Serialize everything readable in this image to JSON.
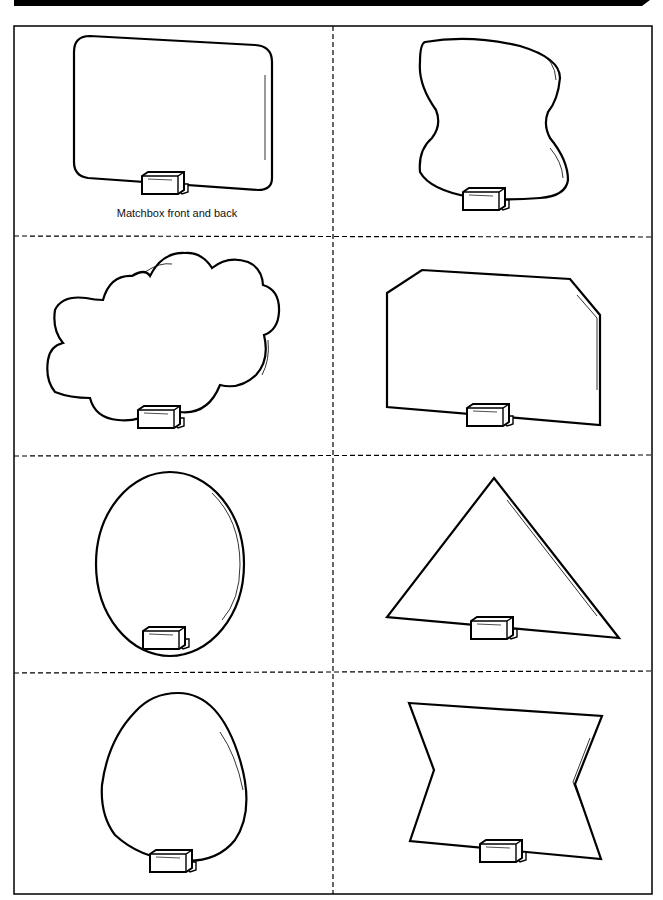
{
  "page": {
    "header_bar": "black banner strip",
    "caption": "Matchbox front and back"
  },
  "cards": [
    {
      "shape": "rounded-rectangle",
      "caption": "Matchbox front and back"
    },
    {
      "shape": "wavy-hourglass"
    },
    {
      "shape": "cloud"
    },
    {
      "shape": "cut-corner-rectangle"
    },
    {
      "shape": "oval"
    },
    {
      "shape": "triangle"
    },
    {
      "shape": "egg"
    },
    {
      "shape": "bowtie"
    }
  ],
  "colors": {
    "ink": "#000000",
    "paper": "#ffffff"
  }
}
